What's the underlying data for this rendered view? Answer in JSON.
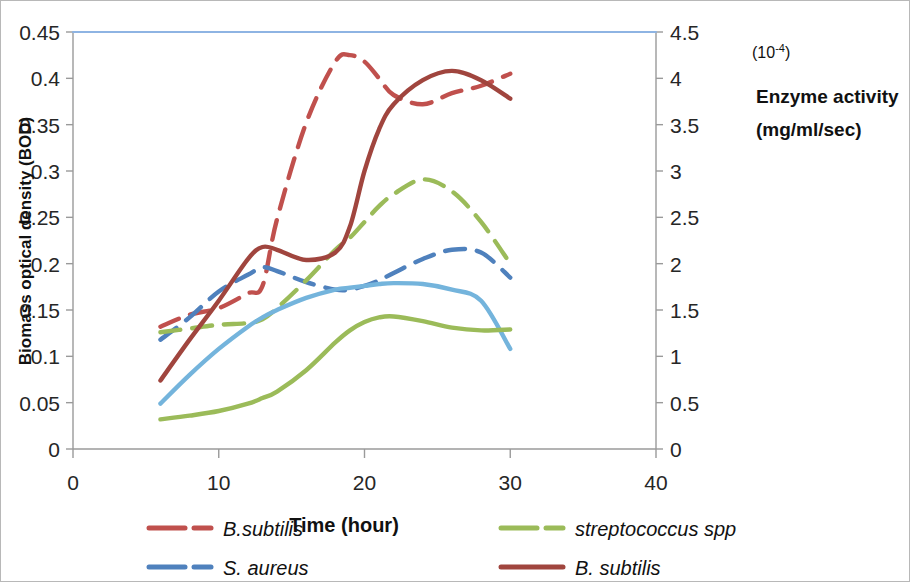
{
  "chart_data": {
    "type": "line",
    "title": "",
    "xlabel": "Time (hour)",
    "ylabel": "Biomass optical density (BOD)",
    "y2label": "Enzyme activity (mg/ml/sec)",
    "y2_scale_note": "(10-4)",
    "xlim": [
      0,
      40
    ],
    "ylim": [
      0,
      0.45
    ],
    "y2lim": [
      0,
      4.5
    ],
    "grid": false,
    "legend_position": "bottom",
    "x_ticks": [
      "0",
      "10",
      "20",
      "30",
      "40"
    ],
    "x_tick_values": [
      0,
      10,
      20,
      30,
      40
    ],
    "y_ticks": [
      "0",
      "0.05",
      "0.1",
      "0.15",
      "0.2",
      "0.25",
      "0.3",
      "0.35",
      "0.4",
      "0.45"
    ],
    "y_tick_values": [
      0,
      0.05,
      0.1,
      0.15,
      0.2,
      0.25,
      0.3,
      0.35,
      0.4,
      0.45
    ],
    "y2_ticks": [
      "0",
      "0.5",
      "1",
      "1.5",
      "2",
      "2.5",
      "3",
      "3.5",
      "4",
      "4.5"
    ],
    "y2_tick_values": [
      0,
      0.5,
      1,
      1.5,
      2,
      2.5,
      3,
      3.5,
      4,
      4.5
    ],
    "x": [
      6,
      8,
      10,
      12,
      13,
      14,
      16,
      18,
      19,
      20,
      21,
      22,
      24,
      26,
      28,
      30
    ],
    "series": [
      {
        "name": "B.subtilis",
        "axis": "right",
        "style": "dashed",
        "color": "#C0504D",
        "values": [
          0.132,
          0.145,
          0.152,
          0.168,
          0.176,
          0.248,
          0.352,
          0.418,
          0.425,
          0.418,
          0.4,
          0.382,
          0.372,
          0.384,
          0.392,
          0.405
        ]
      },
      {
        "name": "S. aureus",
        "axis": "right",
        "style": "dashed",
        "color": "#4F81BD",
        "values": [
          0.118,
          0.142,
          0.17,
          0.188,
          0.196,
          0.192,
          0.18,
          0.172,
          0.172,
          0.176,
          0.182,
          0.19,
          0.205,
          0.215,
          0.212,
          0.185
        ]
      },
      {
        "name": "streptococcus spp",
        "axis": "right",
        "style": "dashed",
        "color": "#9BBB59",
        "values": [
          0.126,
          0.13,
          0.134,
          0.136,
          0.14,
          0.152,
          0.182,
          0.215,
          0.228,
          0.245,
          0.262,
          0.275,
          0.291,
          0.278,
          0.245,
          0.2
        ]
      },
      {
        "name": "B. subtilis",
        "axis": "left",
        "style": "solid",
        "color": "#A0453E",
        "values": [
          0.074,
          0.118,
          0.16,
          0.205,
          0.218,
          0.215,
          0.204,
          0.212,
          0.24,
          0.3,
          0.345,
          0.372,
          0.398,
          0.408,
          0.398,
          0.378
        ]
      },
      {
        "name": "enzyme-blue",
        "axis": "left",
        "style": "solid",
        "color": "#74B4DC",
        "values": [
          0.049,
          0.08,
          0.108,
          0.132,
          0.142,
          0.15,
          0.163,
          0.172,
          0.174,
          0.176,
          0.178,
          0.179,
          0.178,
          0.172,
          0.16,
          0.108
        ]
      },
      {
        "name": "enzyme-green",
        "axis": "left",
        "style": "solid",
        "color": "#9BBB59",
        "values": [
          0.032,
          0.036,
          0.041,
          0.049,
          0.055,
          0.062,
          0.085,
          0.115,
          0.128,
          0.137,
          0.142,
          0.143,
          0.138,
          0.131,
          0.128,
          0.129
        ]
      },
      {
        "name": "top-boundary",
        "axis": "left",
        "style": "solid-flat",
        "color": "#8EB4E3",
        "values": [
          0.45,
          0.45,
          0.45,
          0.45,
          0.45,
          0.45,
          0.45,
          0.45,
          0.45,
          0.45,
          0.45,
          0.45,
          0.45,
          0.45,
          0.45,
          0.45
        ]
      }
    ]
  },
  "axes": {
    "y_left_title": "Biomass optical density (BOD)",
    "y_right_title_line1": "Enzyme activity",
    "y_right_title_line2": "(mg/ml/sec)",
    "y_right_sup": "(10-4)",
    "x_title": "Time (hour)"
  },
  "legend": {
    "items": [
      {
        "label": "B.subtilis",
        "color": "#C0504D",
        "style": "dashed"
      },
      {
        "label": "streptococcus spp",
        "color": "#9BBB59",
        "style": "dashed"
      },
      {
        "label": "S. aureus",
        "color": "#4F81BD",
        "style": "dashed"
      },
      {
        "label": "B. subtilis",
        "color": "#A0453E",
        "style": "solid"
      }
    ]
  },
  "colors": {
    "red_dashed": "#C0504D",
    "red_solid": "#A0453E",
    "blue_dashed": "#4F81BD",
    "blue_solid": "#74B4DC",
    "green": "#9BBB59",
    "top_line": "#8EB4E3",
    "axis": "#9a9a9a",
    "frame": "#b8b8b8"
  }
}
